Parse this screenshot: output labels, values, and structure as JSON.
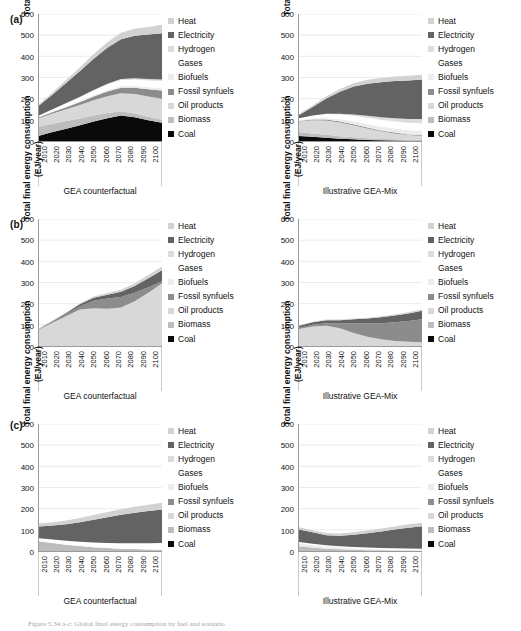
{
  "figure": {
    "caption": "Figure 5.34 a-c: Global final energy consumption by fuel and scenario",
    "y_axis_title_line1": "Total final energy consumption",
    "y_axis_title_line2": "(EJ/year)",
    "y_ticks": [
      "0",
      "100",
      "200",
      "300",
      "400",
      "500",
      "600"
    ],
    "x_ticks": [
      "2010",
      "2020",
      "2030",
      "2040",
      "2050",
      "2060",
      "2070",
      "2080",
      "2090",
      "2100"
    ],
    "panel_labels": [
      "(a)",
      "(b)",
      "(c)"
    ],
    "subtitle_left": "GEA counterfactual",
    "subtitle_right": "Illustrative GEA-Mix"
  },
  "legend": {
    "items": [
      {
        "label": "Heat",
        "color": "#d2d2d2"
      },
      {
        "label": "Electricity",
        "color": "#636363"
      },
      {
        "label": "Hydrogen",
        "color": "#dcdcdc"
      },
      {
        "label": "Gases",
        "color": "#ffffff"
      },
      {
        "label": "Biofuels",
        "color": "#ececec"
      },
      {
        "label": "Fossil synfuels",
        "color": "#8c8c8c"
      },
      {
        "label": "Oil products",
        "color": "#d8d8d8"
      },
      {
        "label": "Biomass",
        "color": "#bdbdbd"
      },
      {
        "label": "Coal",
        "color": "#0a0a0a"
      }
    ]
  },
  "chart_data": [
    {
      "id": "a-left",
      "type": "area",
      "panel": "(a)",
      "title": "GEA counterfactual",
      "xlabel": "",
      "ylabel": "Total final energy consumption (EJ/year)",
      "ylim": [
        0,
        600
      ],
      "grid": true,
      "legend_position": "right",
      "x": [
        2010,
        2020,
        2030,
        2040,
        2050,
        2060,
        2070,
        2080,
        2090,
        2100
      ],
      "series": [
        {
          "name": "Coal",
          "color": "#0a0a0a",
          "values": [
            25,
            42,
            58,
            74,
            92,
            108,
            120,
            112,
            98,
            86
          ]
        },
        {
          "name": "Biomass",
          "color": "#bdbdbd",
          "values": [
            42,
            40,
            36,
            32,
            28,
            24,
            20,
            18,
            16,
            14
          ]
        },
        {
          "name": "Oil products",
          "color": "#d8d8d8",
          "values": [
            40,
            48,
            56,
            64,
            72,
            80,
            86,
            92,
            96,
            100
          ]
        },
        {
          "name": "Fossil synfuels",
          "color": "#8c8c8c",
          "values": [
            5,
            7,
            10,
            14,
            18,
            22,
            26,
            30,
            34,
            38
          ]
        },
        {
          "name": "Biofuels",
          "color": "#ececec",
          "values": [
            2,
            3,
            4,
            5,
            6,
            7,
            8,
            9,
            10,
            11
          ]
        },
        {
          "name": "Gases",
          "color": "#ffffff",
          "values": [
            6,
            10,
            14,
            18,
            22,
            26,
            28,
            30,
            32,
            34
          ]
        },
        {
          "name": "Hydrogen",
          "color": "#dcdcdc",
          "values": [
            0,
            0,
            1,
            2,
            3,
            4,
            5,
            6,
            7,
            8
          ]
        },
        {
          "name": "Electricity",
          "color": "#636363",
          "values": [
            48,
            70,
            96,
            122,
            148,
            170,
            188,
            200,
            210,
            218
          ]
        },
        {
          "name": "Heat",
          "color": "#d2d2d2",
          "values": [
            6,
            10,
            14,
            18,
            22,
            26,
            30,
            33,
            36,
            40
          ]
        }
      ],
      "total_2100": 549
    },
    {
      "id": "a-right",
      "type": "area",
      "panel": "(a)",
      "title": "Illustrative GEA-Mix",
      "xlabel": "",
      "ylabel": "Total final energy consumption (EJ/year)",
      "ylim": [
        0,
        600
      ],
      "grid": true,
      "legend_position": "right",
      "x": [
        2010,
        2020,
        2030,
        2040,
        2050,
        2060,
        2070,
        2080,
        2090,
        2100
      ],
      "series": [
        {
          "name": "Coal",
          "color": "#0a0a0a",
          "values": [
            24,
            20,
            15,
            11,
            8,
            5,
            3,
            2,
            1,
            1
          ]
        },
        {
          "name": "Biomass",
          "color": "#bdbdbd",
          "values": [
            18,
            16,
            14,
            12,
            10,
            8,
            7,
            6,
            5,
            5
          ]
        },
        {
          "name": "Oil products",
          "color": "#d8d8d8",
          "values": [
            50,
            62,
            68,
            64,
            56,
            46,
            36,
            28,
            22,
            18
          ]
        },
        {
          "name": "Fossil synfuels",
          "color": "#8c8c8c",
          "values": [
            2,
            3,
            4,
            5,
            5,
            5,
            4,
            4,
            3,
            3
          ]
        },
        {
          "name": "Biofuels",
          "color": "#ececec",
          "values": [
            3,
            5,
            8,
            11,
            14,
            16,
            18,
            19,
            20,
            21
          ]
        },
        {
          "name": "Gases",
          "color": "#ffffff",
          "values": [
            10,
            14,
            18,
            22,
            26,
            30,
            32,
            34,
            35,
            36
          ]
        },
        {
          "name": "Hydrogen",
          "color": "#dcdcdc",
          "values": [
            0,
            1,
            2,
            4,
            6,
            9,
            12,
            15,
            18,
            20
          ]
        },
        {
          "name": "Electricity",
          "color": "#636363",
          "values": [
            16,
            40,
            72,
            104,
            132,
            152,
            166,
            176,
            182,
            186
          ]
        },
        {
          "name": "Heat",
          "color": "#d2d2d2",
          "values": [
            4,
            7,
            10,
            13,
            16,
            18,
            20,
            21,
            22,
            23
          ]
        }
      ],
      "total_2100": 313
    },
    {
      "id": "b-left",
      "type": "area",
      "panel": "(b)",
      "title": "GEA counterfactual",
      "xlabel": "",
      "ylabel": "Total final energy consumption (EJ/year)",
      "ylim": [
        0,
        600
      ],
      "grid": true,
      "legend_position": "right",
      "x": [
        2010,
        2020,
        2030,
        2040,
        2050,
        2060,
        2070,
        2080,
        2090,
        2100
      ],
      "series": [
        {
          "name": "Coal",
          "color": "#0a0a0a",
          "values": [
            0,
            0,
            0,
            0,
            0,
            0,
            0,
            0,
            0,
            0
          ]
        },
        {
          "name": "Biomass",
          "color": "#bdbdbd",
          "values": [
            0,
            0,
            0,
            0,
            0,
            0,
            0,
            0,
            0,
            0
          ]
        },
        {
          "name": "Oil products",
          "color": "#d8d8d8",
          "values": [
            78,
            110,
            142,
            172,
            178,
            176,
            182,
            212,
            252,
            296
          ]
        },
        {
          "name": "Fossil synfuels",
          "color": "#8c8c8c",
          "values": [
            2,
            4,
            8,
            16,
            36,
            48,
            50,
            40,
            26,
            10
          ]
        },
        {
          "name": "Biofuels",
          "color": "#ececec",
          "values": [
            0,
            0,
            0,
            0,
            0,
            0,
            0,
            0,
            0,
            0
          ]
        },
        {
          "name": "Gases",
          "color": "#ffffff",
          "values": [
            0,
            0,
            0,
            0,
            0,
            0,
            0,
            0,
            0,
            0
          ]
        },
        {
          "name": "Hydrogen",
          "color": "#dcdcdc",
          "values": [
            0,
            0,
            0,
            0,
            0,
            0,
            0,
            0,
            0,
            0
          ]
        },
        {
          "name": "Electricity",
          "color": "#636363",
          "values": [
            2,
            4,
            6,
            10,
            14,
            18,
            24,
            32,
            42,
            52
          ]
        },
        {
          "name": "Heat",
          "color": "#d2d2d2",
          "values": [
            1,
            2,
            3,
            4,
            6,
            8,
            10,
            12,
            15,
            18
          ]
        }
      ],
      "total_2100": 376
    },
    {
      "id": "b-right",
      "type": "area",
      "panel": "(b)",
      "title": "Illustrative GEA-Mix",
      "xlabel": "",
      "ylabel": "Total final energy consumption (EJ/year)",
      "ylim": [
        0,
        600
      ],
      "grid": true,
      "legend_position": "right",
      "x": [
        2010,
        2020,
        2030,
        2040,
        2050,
        2060,
        2070,
        2080,
        2090,
        2100
      ],
      "series": [
        {
          "name": "Coal",
          "color": "#0a0a0a",
          "values": [
            0,
            0,
            0,
            0,
            0,
            0,
            0,
            0,
            0,
            0
          ]
        },
        {
          "name": "Biomass",
          "color": "#bdbdbd",
          "values": [
            0,
            0,
            0,
            0,
            0,
            0,
            0,
            0,
            0,
            0
          ]
        },
        {
          "name": "Oil products",
          "color": "#d8d8d8",
          "values": [
            80,
            92,
            96,
            84,
            62,
            44,
            32,
            24,
            20,
            18
          ]
        },
        {
          "name": "Fossil synfuels",
          "color": "#8c8c8c",
          "values": [
            6,
            8,
            12,
            22,
            44,
            62,
            76,
            88,
            98,
            108
          ]
        },
        {
          "name": "Biofuels",
          "color": "#ececec",
          "values": [
            0,
            0,
            0,
            0,
            0,
            0,
            0,
            0,
            0,
            0
          ]
        },
        {
          "name": "Gases",
          "color": "#ffffff",
          "values": [
            0,
            0,
            0,
            0,
            0,
            0,
            0,
            0,
            0,
            0
          ]
        },
        {
          "name": "Hydrogen",
          "color": "#dcdcdc",
          "values": [
            0,
            0,
            0,
            0,
            0,
            0,
            0,
            0,
            0,
            0
          ]
        },
        {
          "name": "Electricity",
          "color": "#636363",
          "values": [
            10,
            12,
            14,
            16,
            20,
            24,
            28,
            32,
            36,
            40
          ]
        },
        {
          "name": "Heat",
          "color": "#d2d2d2",
          "values": [
            2,
            2,
            3,
            3,
            4,
            4,
            5,
            5,
            6,
            6
          ]
        }
      ],
      "total_2100": 172
    },
    {
      "id": "c-left",
      "type": "area",
      "panel": "(c)",
      "title": "GEA counterfactual",
      "xlabel": "",
      "ylabel": "Total final energy consumption (EJ/year)",
      "ylim": [
        0,
        600
      ],
      "grid": true,
      "legend_position": "right",
      "x": [
        2010,
        2020,
        2030,
        2040,
        2050,
        2060,
        2070,
        2080,
        2090,
        2100
      ],
      "series": [
        {
          "name": "Coal",
          "color": "#0a0a0a",
          "values": [
            0,
            0,
            0,
            0,
            0,
            0,
            0,
            0,
            0,
            0
          ]
        },
        {
          "name": "Biomass",
          "color": "#bdbdbd",
          "values": [
            46,
            38,
            30,
            24,
            18,
            14,
            11,
            9,
            7,
            6
          ]
        },
        {
          "name": "Oil products",
          "color": "#d8d8d8",
          "values": [
            0,
            0,
            0,
            0,
            0,
            0,
            0,
            0,
            0,
            0
          ]
        },
        {
          "name": "Fossil synfuels",
          "color": "#8c8c8c",
          "values": [
            0,
            0,
            0,
            0,
            0,
            0,
            0,
            0,
            0,
            0
          ]
        },
        {
          "name": "Biofuels",
          "color": "#ececec",
          "values": [
            0,
            0,
            0,
            0,
            0,
            0,
            0,
            0,
            0,
            0
          ]
        },
        {
          "name": "Gases",
          "color": "#ffffff",
          "values": [
            14,
            16,
            18,
            20,
            22,
            24,
            26,
            28,
            30,
            32
          ]
        },
        {
          "name": "Hydrogen",
          "color": "#dcdcdc",
          "values": [
            0,
            0,
            0,
            0,
            0,
            0,
            0,
            0,
            0,
            0
          ]
        },
        {
          "name": "Electricity",
          "color": "#636363",
          "values": [
            56,
            66,
            78,
            92,
            108,
            122,
            134,
            144,
            152,
            158
          ]
        },
        {
          "name": "Heat",
          "color": "#d2d2d2",
          "values": [
            14,
            16,
            18,
            20,
            22,
            24,
            26,
            28,
            30,
            32
          ]
        }
      ],
      "total_2100": 228
    },
    {
      "id": "c-right",
      "type": "area",
      "panel": "(c)",
      "title": "Illustrative GEA-Mix",
      "xlabel": "",
      "ylabel": "Total final energy consumption (EJ/year)",
      "ylim": [
        0,
        600
      ],
      "grid": true,
      "legend_position": "right",
      "x": [
        2010,
        2020,
        2030,
        2040,
        2050,
        2060,
        2070,
        2080,
        2090,
        2100
      ],
      "series": [
        {
          "name": "Coal",
          "color": "#0a0a0a",
          "values": [
            0,
            0,
            0,
            0,
            0,
            0,
            0,
            0,
            0,
            0
          ]
        },
        {
          "name": "Biomass",
          "color": "#bdbdbd",
          "values": [
            22,
            16,
            11,
            8,
            6,
            4,
            3,
            2,
            2,
            1
          ]
        },
        {
          "name": "Oil products",
          "color": "#d8d8d8",
          "values": [
            0,
            0,
            0,
            0,
            0,
            0,
            0,
            0,
            0,
            0
          ]
        },
        {
          "name": "Fossil synfuels",
          "color": "#8c8c8c",
          "values": [
            0,
            0,
            0,
            0,
            0,
            0,
            0,
            0,
            0,
            0
          ]
        },
        {
          "name": "Biofuels",
          "color": "#ececec",
          "values": [
            14,
            12,
            10,
            8,
            7,
            6,
            5,
            5,
            4,
            4
          ]
        },
        {
          "name": "Gases",
          "color": "#ffffff",
          "values": [
            6,
            6,
            6,
            6,
            6,
            6,
            6,
            6,
            6,
            6
          ]
        },
        {
          "name": "Hydrogen",
          "color": "#dcdcdc",
          "values": [
            0,
            0,
            0,
            0,
            0,
            0,
            0,
            0,
            0,
            0
          ]
        },
        {
          "name": "Electricity",
          "color": "#636363",
          "values": [
            60,
            54,
            48,
            50,
            58,
            68,
            78,
            88,
            98,
            106
          ]
        },
        {
          "name": "Heat",
          "color": "#d2d2d2",
          "values": [
            10,
            10,
            10,
            11,
            12,
            13,
            14,
            15,
            16,
            17
          ]
        }
      ],
      "total_2100": 134
    }
  ]
}
